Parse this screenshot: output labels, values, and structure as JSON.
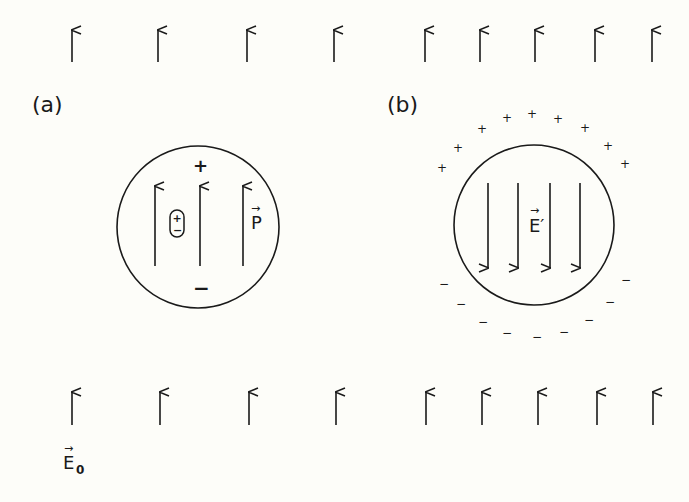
{
  "figure": {
    "panel_a": {
      "label": "(a)",
      "plus_sign": "+",
      "minus_sign": "−",
      "dipole_plus": "+",
      "dipole_minus": "−",
      "vector_label": "P",
      "vector_arrow": "→",
      "interior_arrow_direction": "up"
    },
    "panel_b": {
      "label": "(b)",
      "vector_label": "E′",
      "vector_arrow": "→",
      "surface_charge_top": "+",
      "surface_charge_bottom": "−",
      "interior_arrow_direction": "down"
    },
    "external_field": {
      "label": "E",
      "subscript": "0",
      "vector_arrow": "→",
      "direction": "up"
    },
    "colors": {
      "background": "#fdfdf9",
      "ink": "#1a1a1a"
    }
  }
}
